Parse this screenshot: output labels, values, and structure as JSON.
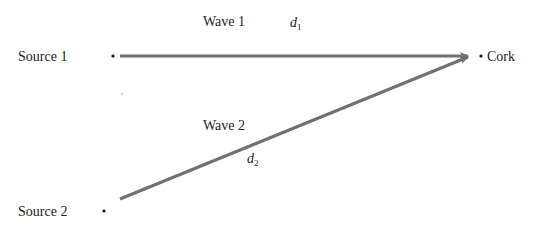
{
  "diagram": {
    "nodes": {
      "source1": {
        "label": "Source 1"
      },
      "source2": {
        "label": "Source 2"
      },
      "cork": {
        "label": "Cork"
      }
    },
    "waves": [
      {
        "label": "Wave 1",
        "distance_symbol": "d",
        "distance_subscript": "1",
        "from": "source1",
        "to": "cork"
      },
      {
        "label": "Wave 2",
        "distance_symbol": "d",
        "distance_subscript": "2",
        "from": "source2",
        "to": "cork"
      }
    ],
    "colors": {
      "wave_line": "#707070",
      "text": "#222222",
      "dot": "#111111"
    }
  }
}
